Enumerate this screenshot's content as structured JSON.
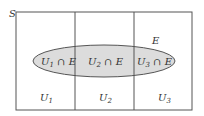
{
  "diagram": {
    "set_label": "S",
    "event_label": "E",
    "partitions": [
      {
        "label": "U",
        "sub": "1"
      },
      {
        "label": "U",
        "sub": "2"
      },
      {
        "label": "U",
        "sub": "3"
      }
    ],
    "intersections": [
      {
        "label": "U",
        "sub": "1",
        "suffix": " ∩ E"
      },
      {
        "label": "U",
        "sub": "2",
        "suffix": " ∩ E"
      },
      {
        "label": "U",
        "sub": "3",
        "suffix": " ∩ E"
      }
    ],
    "colors": {
      "border": "#555555",
      "ellipse_fill": "#dcdcdc",
      "ellipse_stroke": "#555555",
      "text": "#333333"
    }
  }
}
